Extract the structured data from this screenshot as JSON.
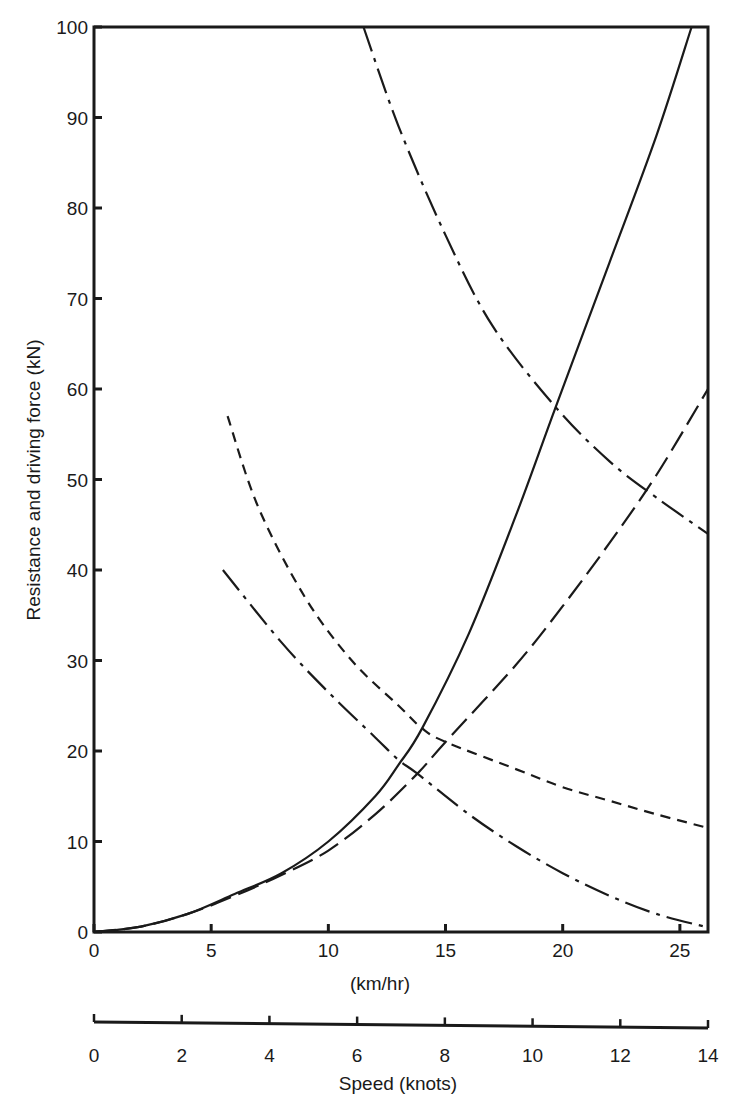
{
  "chart_data": {
    "type": "line",
    "title": "",
    "ylabel": "Resistance and driving force (kN)",
    "xlabel": "(km/hr)",
    "secondary_xlabel": "Speed (knots)",
    "ylim": [
      0,
      100
    ],
    "xlim": [
      0,
      26.2
    ],
    "secondary_xlim": [
      0,
      14
    ],
    "grid": false,
    "legend": null,
    "y_ticks": [
      0,
      10,
      20,
      30,
      40,
      50,
      60,
      70,
      80,
      90,
      100
    ],
    "x_ticks": [
      0,
      5,
      10,
      15,
      20,
      25
    ],
    "secondary_x_ticks": [
      0,
      2,
      4,
      6,
      8,
      10,
      12,
      14
    ],
    "series": [
      {
        "name": "resistance-solid",
        "style": "solid",
        "x": [
          0,
          2,
          4,
          6,
          8,
          10,
          12,
          13,
          14,
          16,
          18,
          19.7,
          22,
          24,
          25.5
        ],
        "y": [
          0,
          0.6,
          2,
          4.2,
          6.5,
          10,
          15,
          18.5,
          22.5,
          33,
          46,
          58,
          74,
          88,
          100
        ]
      },
      {
        "name": "resistance-long-dash",
        "style": "long-dash",
        "x": [
          0,
          2,
          4,
          6,
          8,
          10,
          12,
          13.8,
          15,
          18,
          20,
          22,
          24,
          26.2
        ],
        "y": [
          0,
          0.6,
          2,
          4,
          6.3,
          9,
          13,
          17.5,
          21,
          29.5,
          36,
          43,
          50.5,
          60
        ]
      },
      {
        "name": "driving-force-dash-dot-upper",
        "style": "dash-dot",
        "x": [
          11.5,
          13,
          15,
          17,
          19.7,
          22,
          24,
          26.2
        ],
        "y": [
          100,
          89,
          77,
          67,
          58,
          52,
          48,
          44
        ]
      },
      {
        "name": "thrust-short-dash",
        "style": "short-dash",
        "x": [
          5.7,
          7,
          9,
          11,
          13,
          14,
          15,
          18,
          20,
          22,
          24,
          26.2
        ],
        "y": [
          57,
          47,
          37,
          30,
          25,
          22.5,
          21,
          18,
          16,
          14.5,
          13,
          11.5
        ]
      },
      {
        "name": "driving-force-dash-dot-lower",
        "style": "dash-dot",
        "x": [
          5.5,
          8,
          10,
          12,
          13,
          13.8,
          16,
          18,
          20,
          22,
          24,
          26.2
        ],
        "y": [
          40,
          32,
          26.5,
          21.5,
          19,
          17.5,
          13,
          9.5,
          6.5,
          4,
          2,
          0.5
        ]
      }
    ]
  },
  "labels": {
    "y_axis_title": "Resistance and driving force (kN)",
    "x_axis_title": "(km/hr)",
    "secondary_x_axis_title": "Speed (knots)"
  }
}
